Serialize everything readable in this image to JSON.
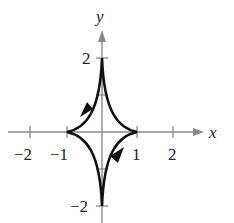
{
  "figure": {
    "type": "parametric-curve",
    "axes": {
      "x_label": "x",
      "y_label": "y",
      "x_ticks": [
        {
          "value": -2,
          "label": "−2"
        },
        {
          "value": -1,
          "label": "−1"
        },
        {
          "value": 1,
          "label": "1"
        },
        {
          "value": 2,
          "label": "2"
        }
      ],
      "y_ticks": [
        {
          "value": 2,
          "label": "2"
        },
        {
          "value": 1,
          "label": ""
        },
        {
          "value": -1,
          "label": ""
        },
        {
          "value": -2,
          "label": "−2"
        }
      ]
    },
    "cusps": [
      [
        1,
        0
      ],
      [
        0,
        2
      ],
      [
        -1,
        0
      ],
      [
        0,
        -2
      ]
    ],
    "direction_arrows": [
      {
        "quadrant": "II",
        "direction": "down-left"
      },
      {
        "quadrant": "IV",
        "direction": "up-right"
      }
    ],
    "colors": {
      "axis": "#8a8a8a",
      "curve": "#111111",
      "text": "#222222"
    }
  }
}
